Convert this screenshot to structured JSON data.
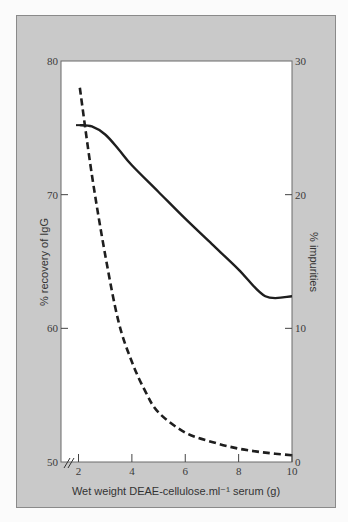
{
  "chart_data": {
    "type": "line",
    "title": "",
    "xlabel": "Wet weight DEAE-cellulose.ml⁻¹ serum (g)",
    "ylabel": "% recovery of IgG",
    "y2label": "% impurities",
    "xlim": [
      2,
      10
    ],
    "ylim": [
      50,
      80
    ],
    "y2lim": [
      0,
      30
    ],
    "x_ticks": [
      2,
      4,
      6,
      8,
      10
    ],
    "y_ticks": [
      50,
      60,
      70,
      80
    ],
    "y2_ticks": [
      0,
      10,
      20,
      30
    ],
    "axis_break": "x-axis broken near origin (//)",
    "grid": false,
    "legend": null,
    "series": [
      {
        "name": "% recovery of IgG",
        "axis": "left",
        "style": "solid",
        "x": [
          2.05,
          2.5,
          3.0,
          3.5,
          4.0,
          5.0,
          6.0,
          7.0,
          8.0,
          9.0,
          10.0
        ],
        "values": [
          75.2,
          75.1,
          74.5,
          73.4,
          72.2,
          70.2,
          68.2,
          66.3,
          64.4,
          62.4,
          62.4
        ]
      },
      {
        "name": "% impurities",
        "axis": "right",
        "style": "dashed",
        "x": [
          2.05,
          2.5,
          3.0,
          3.5,
          4.0,
          4.5,
          5.0,
          6.0,
          7.0,
          8.0,
          9.0,
          10.0
        ],
        "values": [
          28.0,
          21.5,
          15.5,
          10.5,
          7.5,
          5.3,
          3.7,
          2.2,
          1.5,
          1.0,
          0.7,
          0.5
        ]
      }
    ]
  }
}
